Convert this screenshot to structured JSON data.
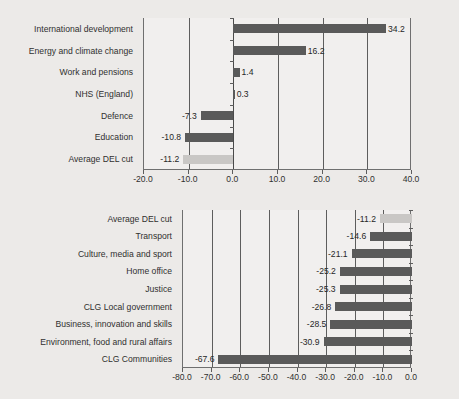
{
  "background_color": "#eceae8",
  "colors": {
    "bar": "#5a5a5a",
    "bar_highlight": "#c9c7c5",
    "axis": "#5d5d5d",
    "plot_background": "#f1efee",
    "text": "#30302f"
  },
  "chart_data": [
    {
      "id": "top",
      "type": "bar",
      "orientation": "horizontal",
      "title": "",
      "subtitle": "",
      "xlabel": "",
      "ylabel": "",
      "xlim": [
        -20.0,
        40.0
      ],
      "xticks": [
        -20.0,
        -10.0,
        0.0,
        10.0,
        20.0,
        30.0,
        40.0
      ],
      "xtick_labels": [
        "-20.0",
        "-10.0",
        "0.0",
        "10.0",
        "20.0",
        "30.0",
        "40.0"
      ],
      "grid": true,
      "legend": false,
      "categories": [
        "International development",
        "Energy and climate change",
        "Work and pensions",
        "NHS (England)",
        "Defence",
        "Education",
        "Average DEL cut"
      ],
      "values": [
        34.2,
        16.2,
        1.4,
        0.3,
        -7.3,
        -10.8,
        -11.2
      ],
      "data_labels": [
        "34.2",
        "16.2",
        "1.4",
        "0.3",
        "-7.3",
        "-10.8",
        "-11.2"
      ],
      "highlight_index": 6
    },
    {
      "id": "bottom",
      "type": "bar",
      "orientation": "horizontal",
      "title": "",
      "subtitle": "",
      "xlabel": "",
      "ylabel": "",
      "xlim": [
        -80.0,
        0.0
      ],
      "xticks": [
        -80.0,
        -70.0,
        -60.0,
        -50.0,
        -40.0,
        -30.0,
        -20.0,
        -10.0,
        0.0
      ],
      "xtick_labels": [
        "-80.0",
        "-70.0",
        "-60.0",
        "-50.0",
        "-40.0",
        "-30.0",
        "-20.0",
        "-10.0",
        "0.0"
      ],
      "grid": true,
      "legend": false,
      "categories": [
        "Average DEL cut",
        "Transport",
        "Culture, media and sport",
        "Home office",
        "Justice",
        "CLG Local government",
        "Business, innovation and skills",
        "Environment, food and rural affairs",
        "CLG Communities"
      ],
      "values": [
        -11.2,
        -14.6,
        -21.1,
        -25.2,
        -25.3,
        -26.8,
        -28.5,
        -30.9,
        -67.6
      ],
      "data_labels": [
        "-11.2",
        "-14.6",
        "-21.1",
        "-25.2",
        "-25.3",
        "-26.8",
        "-28.5",
        "-30.9",
        "-67.6"
      ],
      "highlight_index": 0
    }
  ]
}
